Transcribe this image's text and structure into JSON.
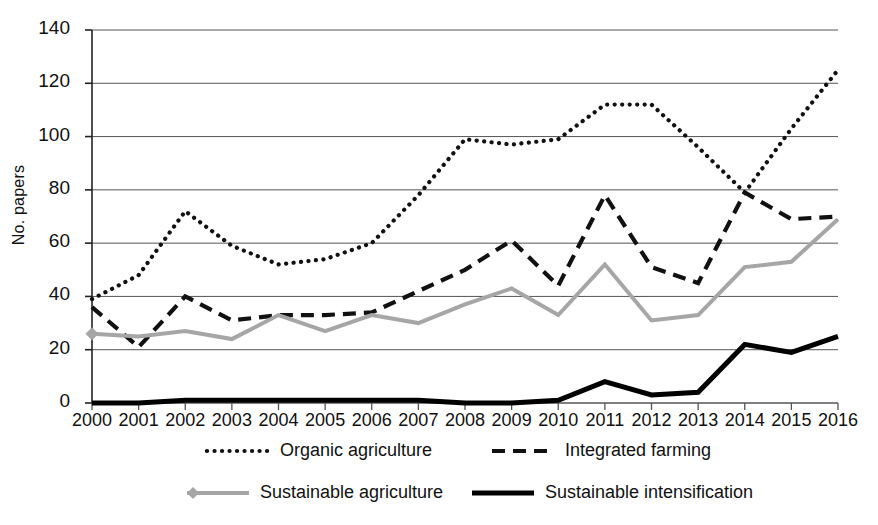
{
  "chart_data": {
    "type": "line",
    "title": "",
    "xlabel": "",
    "ylabel": "No. papers",
    "x": [
      2000,
      2001,
      2002,
      2003,
      2004,
      2005,
      2006,
      2007,
      2008,
      2009,
      2010,
      2011,
      2012,
      2013,
      2014,
      2015,
      2016
    ],
    "xtick_labels": [
      "2000",
      "2001",
      "2002",
      "2003",
      "2004",
      "2005",
      "2006",
      "2007",
      "2008",
      "2009",
      "2010",
      "2011",
      "2012",
      "2013",
      "2014",
      "2015",
      "2016"
    ],
    "ytick_labels": [
      "0",
      "20",
      "40",
      "60",
      "80",
      "100",
      "120",
      "140"
    ],
    "yticks": [
      0,
      20,
      40,
      60,
      80,
      100,
      120,
      140
    ],
    "ylim": [
      0,
      140
    ],
    "xlim": [
      2000,
      2016
    ],
    "grid": "horizontal",
    "legend_position": "bottom",
    "series": [
      {
        "name": "Organic agriculture",
        "style": "dotted",
        "color": "#111111",
        "values": [
          39,
          48,
          72,
          59,
          52,
          54,
          60,
          78,
          99,
          97,
          99,
          112,
          112,
          96,
          79,
          103,
          125
        ]
      },
      {
        "name": "Integrated farming",
        "style": "dashed",
        "color": "#111111",
        "values": [
          36,
          21,
          40,
          31,
          33,
          33,
          34,
          42,
          50,
          61,
          44,
          78,
          51,
          45,
          79,
          69,
          70
        ]
      },
      {
        "name": "Sustainable agriculture",
        "style": "solid-marker",
        "color": "#a6a6a6",
        "values": [
          26,
          25,
          27,
          24,
          33,
          27,
          33,
          30,
          37,
          43,
          33,
          52,
          31,
          33,
          51,
          53,
          69
        ]
      },
      {
        "name": "Sustainable intensification",
        "style": "solid-thick",
        "color": "#000000",
        "values": [
          0,
          0,
          1,
          1,
          1,
          1,
          1,
          1,
          0,
          0,
          1,
          8,
          3,
          4,
          22,
          19,
          25
        ]
      }
    ]
  },
  "legend": {
    "items": [
      {
        "label": "Organic agriculture",
        "key": "dotted-line-key"
      },
      {
        "label": "Integrated farming",
        "key": "dashed-line-key"
      },
      {
        "label": "Sustainable agriculture",
        "key": "gray-marker-line-key"
      },
      {
        "label": "Sustainable intensification",
        "key": "thick-solid-line-key"
      }
    ]
  }
}
